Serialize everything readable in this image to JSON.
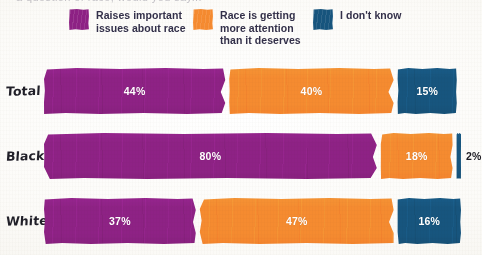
{
  "figure": {
    "background_color": "#fbfaf7",
    "cropped_top_text": "a question of race, would you say..."
  },
  "legend": {
    "position": "top",
    "items": [
      {
        "label": "Raises important\nissues about race",
        "color": "#8E2285",
        "key": "raises-issues"
      },
      {
        "label": "Race is getting\nmore attention\nthan it deserves",
        "color": "#F58B30",
        "key": "too-much-attention"
      },
      {
        "label": "I don't know",
        "color": "#17557E",
        "key": "dont-know"
      }
    ]
  },
  "chart_data": {
    "type": "bar",
    "orientation": "horizontal",
    "stacked": true,
    "normalized_percent": true,
    "title": "",
    "xlabel": "",
    "ylabel": "",
    "xlim": [
      0,
      100
    ],
    "grid": false,
    "legend_position": "top",
    "categories": [
      "Total",
      "Black",
      "White"
    ],
    "series": [
      {
        "name": "Raises important issues about race",
        "color": "#8E2285",
        "values": [
          44,
          80,
          37
        ]
      },
      {
        "name": "Race is getting more attention than it deserves",
        "color": "#F58B30",
        "values": [
          40,
          18,
          47
        ]
      },
      {
        "name": "I don't know",
        "color": "#17557E",
        "values": [
          15,
          2,
          16
        ]
      }
    ],
    "data_labels": [
      {
        "category": "Total",
        "values": [
          "44%",
          "40%",
          "15%"
        ]
      },
      {
        "category": "Black",
        "values": [
          "80%",
          "18%",
          "2%"
        ]
      },
      {
        "category": "White",
        "values": [
          "37%",
          "47%",
          "16%"
        ]
      }
    ]
  },
  "rows": [
    {
      "label": "Total",
      "segments": [
        {
          "key": "raises-issues",
          "label": "44%",
          "value": 44,
          "color": "#8E2285",
          "label_outside": false
        },
        {
          "key": "too-much-attention",
          "label": "40%",
          "value": 40,
          "color": "#F58B30",
          "label_outside": false
        },
        {
          "key": "dont-know",
          "label": "15%",
          "value": 15,
          "color": "#17557E",
          "label_outside": false
        }
      ]
    },
    {
      "label": "Black",
      "segments": [
        {
          "key": "raises-issues",
          "label": "80%",
          "value": 80,
          "color": "#8E2285",
          "label_outside": false
        },
        {
          "key": "too-much-attention",
          "label": "18%",
          "value": 18,
          "color": "#F58B30",
          "label_outside": false
        },
        {
          "key": "dont-know",
          "label": "2%",
          "value": 2,
          "color": "#17557E",
          "label_outside": true
        }
      ]
    },
    {
      "label": "White",
      "segments": [
        {
          "key": "raises-issues",
          "label": "37%",
          "value": 37,
          "color": "#8E2285",
          "label_outside": false
        },
        {
          "key": "too-much-attention",
          "label": "47%",
          "value": 47,
          "color": "#F58B30",
          "label_outside": false
        },
        {
          "key": "dont-know",
          "label": "16%",
          "value": 16,
          "color": "#17557E",
          "label_outside": false
        }
      ]
    }
  ]
}
